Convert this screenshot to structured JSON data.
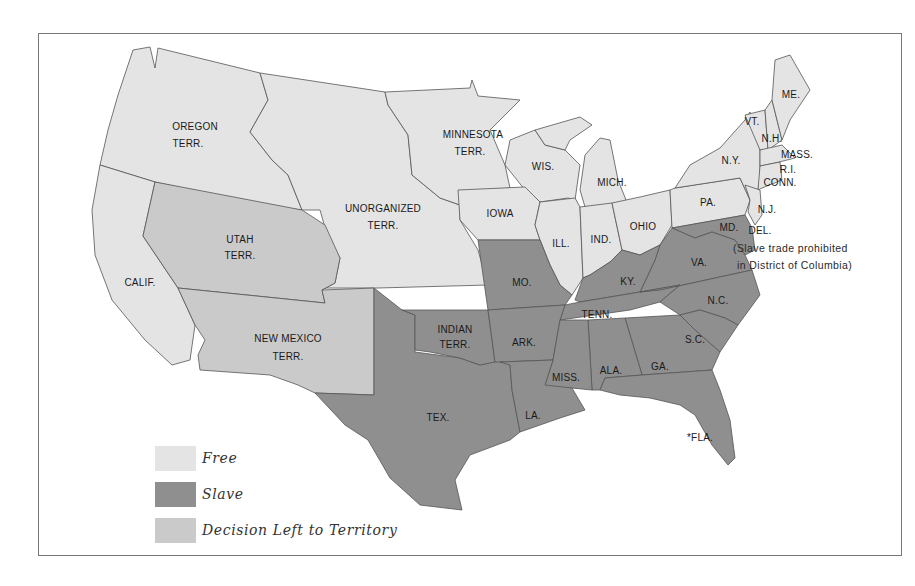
{
  "colors": {
    "free": "#e4e4e4",
    "slave": "#8f8f8f",
    "territory_decision": "#cacaca",
    "border": "#555555",
    "frame": "#777777"
  },
  "legend": [
    {
      "key": "free",
      "label": "Free"
    },
    {
      "key": "slave",
      "label": "Slave"
    },
    {
      "key": "territory_decision",
      "label": "Decision Left to Territory"
    }
  ],
  "note": {
    "line1": "(Slave trade prohibited",
    "line2": "in District of Columbia)"
  },
  "regions": {
    "oregon": {
      "l1": "OREGON",
      "l2": "TERR.",
      "status": "free"
    },
    "minnesota": {
      "l1": "MINNESOTA",
      "l2": "TERR.",
      "status": "free"
    },
    "unorganized": {
      "l1": "UNORGANIZED",
      "l2": "TERR.",
      "status": "free"
    },
    "utah": {
      "l1": "UTAH",
      "l2": "TERR.",
      "status": "territory_decision"
    },
    "new_mexico": {
      "l1": "NEW MEXICO",
      "l2": "TERR.",
      "status": "territory_decision"
    },
    "indian": {
      "l1": "INDIAN",
      "l2": "TERR.",
      "status": "slave"
    },
    "calif": {
      "l1": "CALIF.",
      "status": "free"
    },
    "wis": {
      "l1": "WIS.",
      "status": "free"
    },
    "mich": {
      "l1": "MICH.",
      "status": "free"
    },
    "iowa": {
      "l1": "IOWA",
      "status": "free"
    },
    "ill": {
      "l1": "ILL.",
      "status": "free"
    },
    "ind": {
      "l1": "IND.",
      "status": "free"
    },
    "ohio": {
      "l1": "OHIO",
      "status": "free"
    },
    "pa": {
      "l1": "PA.",
      "status": "free"
    },
    "ny": {
      "l1": "N.Y.",
      "status": "free"
    },
    "vt": {
      "l1": "VT.",
      "status": "free"
    },
    "nh": {
      "l1": "N.H.",
      "status": "free"
    },
    "me": {
      "l1": "ME.",
      "status": "free"
    },
    "mass": {
      "l1": "MASS.",
      "status": "free"
    },
    "ri": {
      "l1": "R.I.",
      "status": "free"
    },
    "conn": {
      "l1": "CONN.",
      "status": "free"
    },
    "nj": {
      "l1": "N.J.",
      "status": "free"
    },
    "md": {
      "l1": "MD.",
      "status": "slave"
    },
    "del": {
      "l1": "DEL.",
      "status": "slave"
    },
    "va": {
      "l1": "VA.",
      "status": "slave"
    },
    "nc": {
      "l1": "N.C.",
      "status": "slave"
    },
    "sc": {
      "l1": "S.C.",
      "status": "slave"
    },
    "ga": {
      "l1": "GA.",
      "status": "slave"
    },
    "fla": {
      "l1": "*FLA.",
      "status": "slave"
    },
    "ala": {
      "l1": "ALA.",
      "status": "slave"
    },
    "miss": {
      "l1": "MISS.",
      "status": "slave"
    },
    "la": {
      "l1": "LA.",
      "status": "slave"
    },
    "tenn": {
      "l1": "TENN.",
      "status": "slave"
    },
    "ky": {
      "l1": "KY.",
      "status": "slave"
    },
    "mo": {
      "l1": "MO.",
      "status": "slave"
    },
    "ark": {
      "l1": "ARK.",
      "status": "slave"
    },
    "tex": {
      "l1": "TEX.",
      "status": "slave"
    }
  }
}
